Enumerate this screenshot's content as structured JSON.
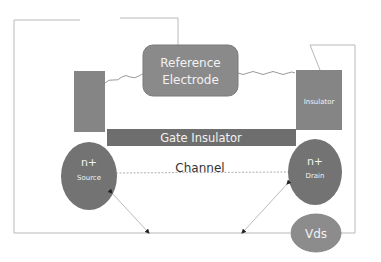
{
  "diagram": {
    "type": "ISFET cross-section schematic",
    "colors": {
      "background": "#ffffff",
      "component_fill": "#7f7f7f",
      "component_fill_light": "#8c8c8c",
      "gate_bar_fill": "#6f6f6f",
      "wire": "#b5b5b5",
      "label_light": "#f2f2f2",
      "label_dark": "#333333"
    },
    "components": {
      "reference_electrode": {
        "line1": "Reference",
        "line2": "Electrode"
      },
      "gate_insulator": {
        "label": "Gate Insulator"
      },
      "right_block": {
        "label": "Insulator"
      },
      "left_block": {
        "label": ""
      },
      "source": {
        "line1": "n+",
        "line2": "Source"
      },
      "drain": {
        "line1": "n+",
        "line2": "Drain"
      },
      "channel": {
        "label": "Channel"
      },
      "voltage_source": {
        "label": "Vds"
      }
    }
  }
}
